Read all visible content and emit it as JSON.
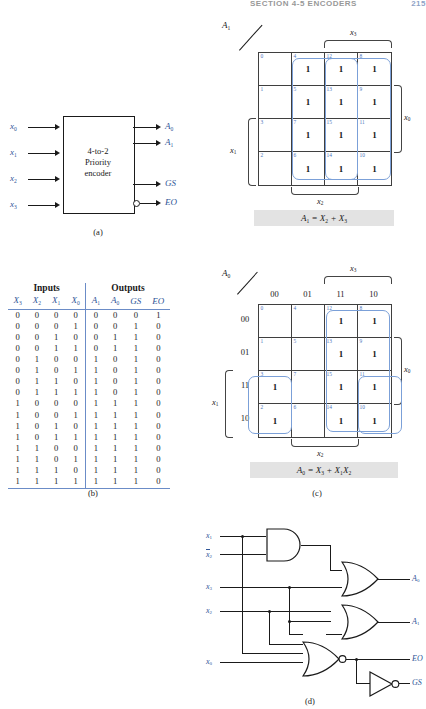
{
  "header": {
    "section": "SECTION 4-5  ENCODERS",
    "page_number": "215"
  },
  "panel_a": {
    "caption": "(a)",
    "block_line1": "4-to-2",
    "block_line2": "Priority",
    "block_line3": "encoder",
    "inputs": [
      "x0",
      "x1",
      "x2",
      "x3"
    ],
    "inputs_display": [
      "x",
      "x",
      "x",
      "x"
    ],
    "input_subs": [
      "0",
      "1",
      "2",
      "3"
    ],
    "outputs_display": [
      "A",
      "A",
      "GS",
      "EO"
    ],
    "output_subs": [
      "0",
      "1",
      "",
      ""
    ],
    "eo_has_bubble": true
  },
  "panel_b": {
    "caption": "(b)",
    "group_headers": [
      "Inputs",
      "Outputs"
    ],
    "columns": [
      "X3",
      "X2",
      "X1",
      "X0",
      "A1",
      "A0",
      "GS",
      "EO"
    ],
    "column_display": [
      "X",
      "X",
      "X",
      "X",
      "A",
      "A",
      "GS",
      "EO"
    ],
    "column_subs": [
      "3",
      "2",
      "1",
      "0",
      "1",
      "0",
      "",
      ""
    ],
    "rows": [
      [
        "0",
        "0",
        "0",
        "0",
        "0",
        "0",
        "0",
        "1"
      ],
      [
        "0",
        "0",
        "0",
        "1",
        "0",
        "0",
        "1",
        "0"
      ],
      [
        "0",
        "0",
        "1",
        "0",
        "0",
        "1",
        "1",
        "0"
      ],
      [
        "0",
        "0",
        "1",
        "1",
        "0",
        "1",
        "1",
        "0"
      ],
      [
        "0",
        "1",
        "0",
        "0",
        "1",
        "0",
        "1",
        "0"
      ],
      [
        "0",
        "1",
        "0",
        "1",
        "1",
        "0",
        "1",
        "0"
      ],
      [
        "0",
        "1",
        "1",
        "0",
        "1",
        "0",
        "1",
        "0"
      ],
      [
        "0",
        "1",
        "1",
        "1",
        "1",
        "0",
        "1",
        "0"
      ],
      [
        "1",
        "0",
        "0",
        "0",
        "1",
        "1",
        "1",
        "0"
      ],
      [
        "1",
        "0",
        "0",
        "1",
        "1",
        "1",
        "1",
        "0"
      ],
      [
        "1",
        "0",
        "1",
        "0",
        "1",
        "1",
        "1",
        "0"
      ],
      [
        "1",
        "0",
        "1",
        "1",
        "1",
        "1",
        "1",
        "0"
      ],
      [
        "1",
        "1",
        "0",
        "0",
        "1",
        "1",
        "1",
        "0"
      ],
      [
        "1",
        "1",
        "0",
        "1",
        "1",
        "1",
        "1",
        "0"
      ],
      [
        "1",
        "1",
        "1",
        "0",
        "1",
        "1",
        "1",
        "0"
      ],
      [
        "1",
        "1",
        "1",
        "1",
        "1",
        "1",
        "1",
        "0"
      ]
    ]
  },
  "kmap_a1": {
    "title": "A1",
    "title_display": "A",
    "title_sub": "1",
    "cell_numbers": [
      [
        "0",
        "4",
        "12",
        "8"
      ],
      [
        "1",
        "5",
        "13",
        "9"
      ],
      [
        "3",
        "7",
        "15",
        "11"
      ],
      [
        "2",
        "6",
        "14",
        "10"
      ]
    ],
    "cell_values": [
      [
        "",
        "1",
        "1",
        "1"
      ],
      [
        "",
        "1",
        "1",
        "1"
      ],
      [
        "",
        "1",
        "1",
        "1"
      ],
      [
        "",
        "1",
        "1",
        "1"
      ]
    ],
    "bracket_labels": {
      "top": "x3",
      "bottom": "x2",
      "right": "x0",
      "left": "x1"
    },
    "bracket_display": {
      "top": "x",
      "bottom": "x",
      "right": "x",
      "left": "x"
    },
    "bracket_subs": {
      "top": "3",
      "bottom": "2",
      "right": "0",
      "left": "1"
    },
    "equation": "A1 = X2 + X3",
    "equation_parts": {
      "lhs": "A",
      "lhs_sub": "1",
      "rhs_a": "X",
      "rhs_a_sub": "2",
      "rhs_b": "X",
      "rhs_b_sub": "3"
    }
  },
  "kmap_a0": {
    "title": "A0",
    "title_display": "A",
    "title_sub": "0",
    "col_headers": [
      "00",
      "01",
      "11",
      "10"
    ],
    "row_headers": [
      "00",
      "01",
      "11",
      "10"
    ],
    "cell_numbers": [
      [
        "0",
        "4",
        "12",
        "8"
      ],
      [
        "1",
        "5",
        "13",
        "9"
      ],
      [
        "3",
        "7",
        "15",
        "11"
      ],
      [
        "2",
        "6",
        "14",
        "10"
      ]
    ],
    "cell_values": [
      [
        "",
        "",
        "1",
        "1"
      ],
      [
        "",
        "",
        "1",
        "1"
      ],
      [
        "1",
        "",
        "1",
        "1"
      ],
      [
        "1",
        "",
        "1",
        "1"
      ]
    ],
    "bracket_labels": {
      "top": "x3",
      "bottom": "x2",
      "right": "x0",
      "left": "x1"
    },
    "bracket_display": {
      "top": "x",
      "bottom": "x",
      "right": "x",
      "left": "x"
    },
    "bracket_subs": {
      "top": "3",
      "bottom": "2",
      "right": "0",
      "left": "1"
    },
    "equation": "A0 = X3 + X1X2",
    "equation_parts": {
      "lhs": "A",
      "lhs_sub": "0",
      "rhs_a": "X",
      "rhs_a_sub": "3",
      "rhs_b": "X",
      "rhs_b_sub": "1",
      "rhs_c": "X",
      "rhs_c_sub": "2"
    },
    "caption": "(c)"
  },
  "panel_d": {
    "caption": "(d)",
    "input_labels": [
      "x1",
      "x2bar",
      "x3",
      "x2",
      "x0"
    ],
    "input_display": [
      "x",
      "x",
      "x",
      "x",
      "x"
    ],
    "input_subs": [
      "1",
      "2",
      "3",
      "2",
      "0"
    ],
    "output_labels": [
      "A0",
      "A1",
      "EO",
      "GS"
    ],
    "output_display": [
      "A",
      "A",
      "EO",
      "GS"
    ],
    "output_subs": [
      "0",
      "1",
      "",
      ""
    ],
    "gates": [
      "and-gate",
      "or-gate-a0",
      "or-gate-a1",
      "nor-gate-eo",
      "inverter-gs"
    ]
  },
  "colors": {
    "label_blue": "#2f5597",
    "kmap_group_blue": "#7ba0d8",
    "kmap_cellnum_blue": "#4f76bb",
    "rule_blue": "#6b8cc7",
    "ink": "#1a1a1a",
    "eqn_bg": "#e3e3e3"
  }
}
